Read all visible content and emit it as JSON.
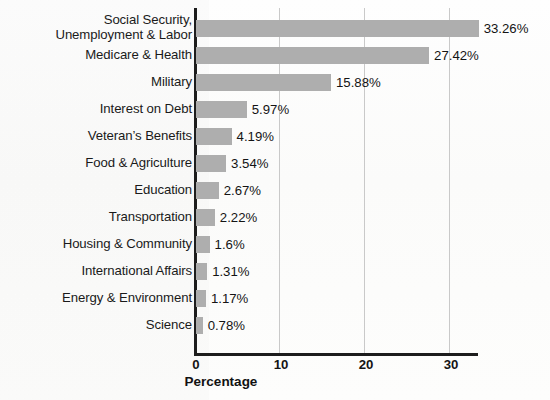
{
  "chart_data": {
    "type": "bar",
    "orientation": "horizontal",
    "title": "",
    "xlabel": "Percentage",
    "ylabel": "",
    "xlim": [
      0,
      33.2
    ],
    "xticks": [
      0,
      10,
      20,
      30
    ],
    "xtick_labels": [
      "0",
      "10",
      "20",
      "30"
    ],
    "grid": "vertical",
    "legend": "none",
    "bar_color": "#aeaeae",
    "axis_color": "#1d1d1d",
    "categories": [
      "Social Security,\nUnemployment & Labor",
      "Medicare & Health",
      "Military",
      "Interest on Debt",
      "Veteran’s Benefits",
      "Food & Agriculture",
      "Education",
      "Transportation",
      "Housing & Community",
      "International Affairs",
      "Energy & Environment",
      "Science"
    ],
    "values": [
      33.26,
      27.42,
      15.88,
      5.97,
      4.19,
      3.54,
      2.67,
      2.22,
      1.6,
      1.31,
      1.17,
      0.78
    ],
    "value_labels": [
      "33.26%",
      "27.42%",
      "15.88%",
      "5.97%",
      "4.19%",
      "3.54%",
      "2.67%",
      "2.22%",
      "1.6%",
      "1.31%",
      "1.17%",
      "0.78%"
    ]
  }
}
